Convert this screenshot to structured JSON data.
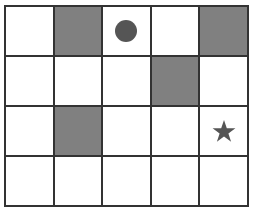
{
  "grid": {
    "rows": 4,
    "cols": 5,
    "colors": {
      "filled": "#808080",
      "empty": "#ffffff",
      "border": "#333333",
      "marker": "#555555"
    },
    "cells": [
      [
        "empty",
        "filled",
        "circle",
        "empty",
        "filled"
      ],
      [
        "empty",
        "empty",
        "empty",
        "filled",
        "empty"
      ],
      [
        "empty",
        "filled",
        "empty",
        "empty",
        "star"
      ],
      [
        "empty",
        "empty",
        "empty",
        "empty",
        "empty"
      ]
    ],
    "markers": [
      {
        "type": "circle",
        "row": 0,
        "col": 2
      },
      {
        "type": "star",
        "row": 2,
        "col": 4
      }
    ]
  }
}
